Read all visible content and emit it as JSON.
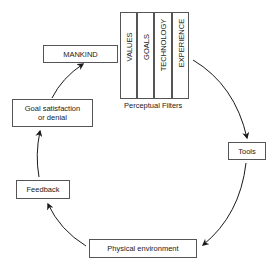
{
  "diagram": {
    "nodes": {
      "mankind": "MANKIND",
      "goal_satisfaction": [
        "Goal satisfaction",
        "or denial"
      ],
      "feedback": "Feedback",
      "physical_environment": "Physical environment",
      "tools": "Tools"
    },
    "filters": {
      "items": [
        "VALUES",
        "GOALS",
        "TECHNOLOGY",
        "EXPERIENCE"
      ],
      "caption": "Perceptual Filters"
    },
    "edges": [
      {
        "from": "Perceptual Filters",
        "to": "Tools"
      },
      {
        "from": "Tools",
        "to": "Physical environment"
      },
      {
        "from": "Physical environment",
        "to": "Feedback"
      },
      {
        "from": "Feedback",
        "to": "Goal satisfaction or denial"
      },
      {
        "from": "Goal satisfaction or denial",
        "to": "MANKIND"
      }
    ],
    "colors": {
      "line": "#1a1a1a",
      "box_border": "#555555",
      "background": "#ffffff"
    }
  }
}
